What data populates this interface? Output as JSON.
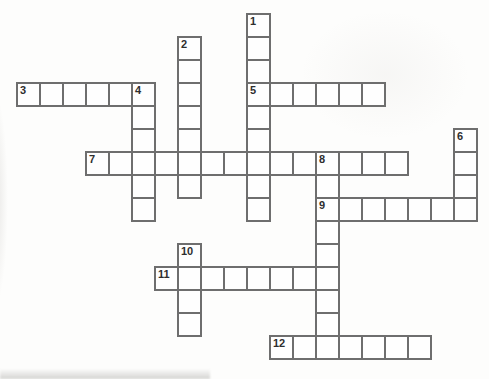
{
  "puzzle": {
    "type": "crossword",
    "grid": {
      "cols": 20,
      "rows": 15,
      "cell_size": 23,
      "origin_x": 16,
      "origin_y": 13,
      "line_width": 2
    },
    "colors": {
      "background": "#fdfdfc",
      "cell_fill": "#fefefe",
      "grid_line": "#6e6e6e",
      "number_color": "#2e2e2e"
    },
    "words": [
      {
        "number": 1,
        "direction": "down",
        "col": 10,
        "row": 0,
        "length": 9
      },
      {
        "number": 2,
        "direction": "down",
        "col": 7,
        "row": 1,
        "length": 7
      },
      {
        "number": 3,
        "direction": "across",
        "col": 0,
        "row": 3,
        "length": 6
      },
      {
        "number": 4,
        "direction": "down",
        "col": 5,
        "row": 3,
        "length": 6
      },
      {
        "number": 5,
        "direction": "across",
        "col": 10,
        "row": 3,
        "length": 6
      },
      {
        "number": 6,
        "direction": "down",
        "col": 19,
        "row": 5,
        "length": 4
      },
      {
        "number": 7,
        "direction": "across",
        "col": 3,
        "row": 6,
        "length": 14
      },
      {
        "number": 8,
        "direction": "down",
        "col": 13,
        "row": 6,
        "length": 9
      },
      {
        "number": 9,
        "direction": "across",
        "col": 13,
        "row": 8,
        "length": 7
      },
      {
        "number": 10,
        "direction": "down",
        "col": 7,
        "row": 10,
        "length": 4
      },
      {
        "number": 11,
        "direction": "across",
        "col": 6,
        "row": 11,
        "length": 8
      },
      {
        "number": 12,
        "direction": "across",
        "col": 11,
        "row": 14,
        "length": 7
      }
    ]
  }
}
